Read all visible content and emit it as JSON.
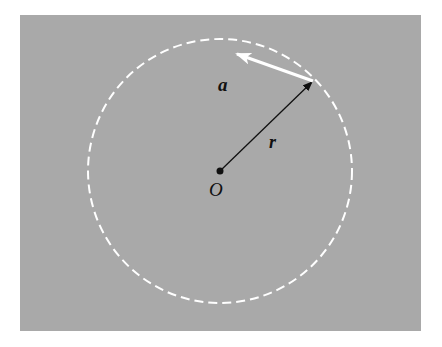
{
  "diagram": {
    "background_color": "#ffffff",
    "panel_color": "#a9a9a9",
    "circle_color": "#ffffff",
    "radius_vector_color": "#111111",
    "acceleration_vector_color": "#ffffff",
    "labels": {
      "acceleration": "a",
      "radius": "r",
      "origin": "O"
    }
  }
}
